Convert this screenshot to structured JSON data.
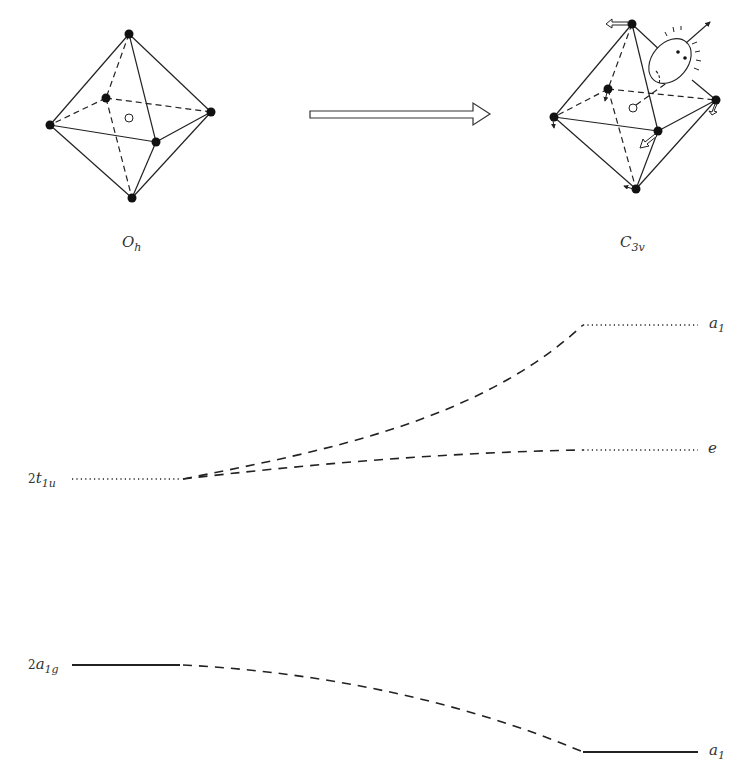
{
  "figure": {
    "colors": {
      "ink": "#222222",
      "label": "#333333",
      "background": "#ffffff"
    },
    "left_structure": {
      "label_main": "O",
      "label_sub": "h",
      "vertices": [
        "top",
        "left",
        "back",
        "right",
        "front",
        "bottom"
      ],
      "center_marker": "open-circle"
    },
    "transform_arrow": {
      "direction": "right"
    },
    "right_structure": {
      "label_main": "C",
      "label_sub": "3v",
      "vertices": [
        "top",
        "left",
        "back",
        "right",
        "front",
        "bottom"
      ],
      "center_marker": "open-circle",
      "annotations": [
        "displacement-arrows",
        "observer-face"
      ]
    }
  },
  "levels": {
    "left": [
      {
        "id": "2t1u",
        "prefix": "2",
        "main": "t",
        "sub": "1u",
        "style": "dotted",
        "y": 479
      },
      {
        "id": "2a1g",
        "prefix": "2",
        "main": "a",
        "sub": "1g",
        "style": "solid",
        "y": 665
      }
    ],
    "right": [
      {
        "id": "a1_upper",
        "main": "a",
        "sub": "1",
        "style": "dotted",
        "y": 325
      },
      {
        "id": "e",
        "main": "e",
        "sub": "",
        "style": "dotted",
        "y": 450
      },
      {
        "id": "a1_lower",
        "main": "a",
        "sub": "1",
        "style": "solid",
        "y": 752
      }
    ],
    "correlations": [
      {
        "from": "2t1u",
        "to": "a1_upper"
      },
      {
        "from": "2t1u",
        "to": "e"
      },
      {
        "from": "2a1g",
        "to": "a1_lower"
      }
    ]
  }
}
